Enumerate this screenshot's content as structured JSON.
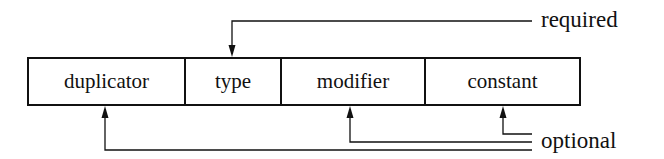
{
  "diagram": {
    "fields": [
      {
        "label": "duplicator",
        "x1": 28,
        "x2": 185,
        "category": "optional"
      },
      {
        "label": "type",
        "x1": 185,
        "x2": 281,
        "category": "required"
      },
      {
        "label": "modifier",
        "x1": 281,
        "x2": 425,
        "category": "optional"
      },
      {
        "label": "constant",
        "x1": 425,
        "x2": 580,
        "category": "optional"
      }
    ],
    "annotations": {
      "required": "required",
      "optional": "optional"
    },
    "line_color": "#111111"
  }
}
